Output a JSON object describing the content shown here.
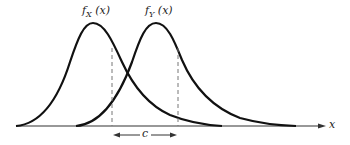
{
  "diagram": {
    "curves": [
      {
        "id": "fX",
        "label_main": "f",
        "label_sub": "X",
        "label_arg": "(x)"
      },
      {
        "id": "fY",
        "label_main": "f",
        "label_sub": "Y",
        "label_arg": "(x)"
      }
    ],
    "axis_label": "x",
    "offset_label": "c",
    "colors": {
      "curve": "#111111",
      "dashed": "#777777",
      "axis": "#333333"
    }
  }
}
